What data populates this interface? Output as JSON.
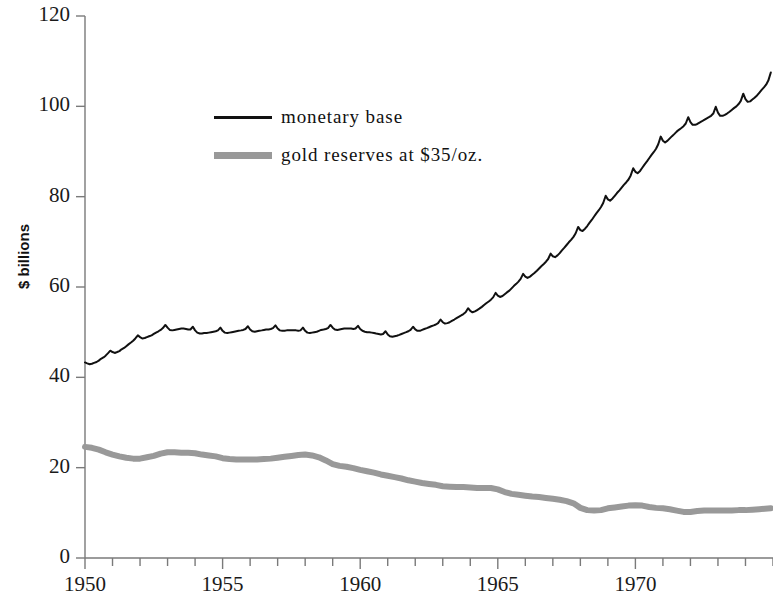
{
  "chart_data": {
    "type": "line",
    "title": "",
    "subtitle": "",
    "xlabel": "",
    "ylabel": "$ billions",
    "xlim": [
      1950,
      1975
    ],
    "ylim": [
      0,
      120
    ],
    "ytick_labels": [
      "0",
      "20",
      "40",
      "60",
      "80",
      "100",
      "120"
    ],
    "ytick_values": [
      0,
      20,
      40,
      60,
      80,
      100,
      120
    ],
    "xtick_labels": [
      "1950",
      "1955",
      "1960",
      "1965",
      "1970"
    ],
    "xtick_values": [
      1950,
      1955,
      1960,
      1965,
      1970
    ],
    "x_minor_tick_interval": 1,
    "grid": false,
    "legend_position": "upper-left-inside",
    "colors": {
      "monetary_base": "#111111",
      "gold_reserves": "#999999",
      "axis": "#7a7a7a",
      "background": "#ffffff"
    },
    "series": [
      {
        "name": "monetary base",
        "color": "#111111",
        "line_width": 2,
        "x": [
          1950.0,
          1950.08,
          1950.17,
          1950.25,
          1950.33,
          1950.42,
          1950.5,
          1950.58,
          1950.67,
          1950.75,
          1950.83,
          1950.92,
          1951.0,
          1951.08,
          1951.17,
          1951.25,
          1951.33,
          1951.42,
          1951.5,
          1951.58,
          1951.67,
          1951.75,
          1951.83,
          1951.92,
          1952.0,
          1952.08,
          1952.17,
          1952.25,
          1952.33,
          1952.42,
          1952.5,
          1952.58,
          1952.67,
          1952.75,
          1952.83,
          1952.92,
          1953.0,
          1953.08,
          1953.17,
          1953.25,
          1953.33,
          1953.42,
          1953.5,
          1953.58,
          1953.67,
          1953.75,
          1953.83,
          1953.92,
          1954.0,
          1954.08,
          1954.17,
          1954.25,
          1954.33,
          1954.42,
          1954.5,
          1954.58,
          1954.67,
          1954.75,
          1954.83,
          1954.92,
          1955.0,
          1955.08,
          1955.17,
          1955.25,
          1955.33,
          1955.42,
          1955.5,
          1955.58,
          1955.67,
          1955.75,
          1955.83,
          1955.92,
          1956.0,
          1956.08,
          1956.17,
          1956.25,
          1956.33,
          1956.42,
          1956.5,
          1956.58,
          1956.67,
          1956.75,
          1956.83,
          1956.92,
          1957.0,
          1957.08,
          1957.17,
          1957.25,
          1957.33,
          1957.42,
          1957.5,
          1957.58,
          1957.67,
          1957.75,
          1957.83,
          1957.92,
          1958.0,
          1958.08,
          1958.17,
          1958.25,
          1958.33,
          1958.42,
          1958.5,
          1958.58,
          1958.67,
          1958.75,
          1958.83,
          1958.92,
          1959.0,
          1959.08,
          1959.17,
          1959.25,
          1959.33,
          1959.42,
          1959.5,
          1959.58,
          1959.67,
          1959.75,
          1959.83,
          1959.92,
          1960.0,
          1960.08,
          1960.17,
          1960.25,
          1960.33,
          1960.42,
          1960.5,
          1960.58,
          1960.67,
          1960.75,
          1960.83,
          1960.92,
          1961.0,
          1961.08,
          1961.17,
          1961.25,
          1961.33,
          1961.42,
          1961.5,
          1961.58,
          1961.67,
          1961.75,
          1961.83,
          1961.92,
          1962.0,
          1962.08,
          1962.17,
          1962.25,
          1962.33,
          1962.42,
          1962.5,
          1962.58,
          1962.67,
          1962.75,
          1962.83,
          1962.92,
          1963.0,
          1963.08,
          1963.17,
          1963.25,
          1963.33,
          1963.42,
          1963.5,
          1963.58,
          1963.67,
          1963.75,
          1963.83,
          1963.92,
          1964.0,
          1964.08,
          1964.17,
          1964.25,
          1964.33,
          1964.42,
          1964.5,
          1964.58,
          1964.67,
          1964.75,
          1964.83,
          1964.92,
          1965.0,
          1965.08,
          1965.17,
          1965.25,
          1965.33,
          1965.42,
          1965.5,
          1965.58,
          1965.67,
          1965.75,
          1965.83,
          1965.92,
          1966.0,
          1966.08,
          1966.17,
          1966.25,
          1966.33,
          1966.42,
          1966.5,
          1966.58,
          1966.67,
          1966.75,
          1966.83,
          1966.92,
          1967.0,
          1967.08,
          1967.17,
          1967.25,
          1967.33,
          1967.42,
          1967.5,
          1967.58,
          1967.67,
          1967.75,
          1967.83,
          1967.92,
          1968.0,
          1968.08,
          1968.17,
          1968.25,
          1968.33,
          1968.42,
          1968.5,
          1968.58,
          1968.67,
          1968.75,
          1968.83,
          1968.92,
          1969.0,
          1969.08,
          1969.17,
          1969.25,
          1969.33,
          1969.42,
          1969.5,
          1969.58,
          1969.67,
          1969.75,
          1969.83,
          1969.92,
          1970.0,
          1970.08,
          1970.17,
          1970.25,
          1970.33,
          1970.42,
          1970.5,
          1970.58,
          1970.67,
          1970.75,
          1970.83,
          1970.92,
          1971.0,
          1971.08,
          1971.17,
          1971.25,
          1971.33,
          1971.42,
          1971.5,
          1971.58,
          1971.67,
          1971.75,
          1971.83,
          1971.92,
          1972.0,
          1972.08,
          1972.17,
          1972.25,
          1972.33,
          1972.42,
          1972.5,
          1972.58,
          1972.67,
          1972.75,
          1972.83,
          1972.92,
          1973.0,
          1973.08,
          1973.17,
          1973.25,
          1973.33,
          1973.42,
          1973.5,
          1973.58,
          1973.67,
          1973.75,
          1973.83,
          1973.92,
          1974.0,
          1974.08,
          1974.17,
          1974.25,
          1974.33,
          1974.42,
          1974.5,
          1974.58,
          1974.67,
          1974.75,
          1974.83,
          1974.92
        ],
        "values": [
          43.3,
          43.1,
          42.9,
          43.0,
          43.2,
          43.4,
          43.7,
          44.1,
          44.4,
          44.8,
          45.3,
          45.9,
          45.6,
          45.4,
          45.6,
          45.8,
          46.2,
          46.5,
          46.9,
          47.3,
          47.7,
          48.1,
          48.6,
          49.3,
          48.9,
          48.6,
          48.7,
          48.9,
          49.1,
          49.3,
          49.6,
          49.9,
          50.2,
          50.5,
          50.9,
          51.6,
          51.0,
          50.5,
          50.4,
          50.5,
          50.6,
          50.7,
          50.8,
          50.8,
          50.7,
          50.6,
          50.6,
          51.2,
          50.4,
          49.9,
          49.7,
          49.7,
          49.8,
          49.8,
          49.9,
          50.0,
          50.1,
          50.2,
          50.4,
          51.0,
          50.3,
          49.9,
          49.8,
          49.9,
          50.0,
          50.1,
          50.2,
          50.3,
          50.4,
          50.5,
          50.7,
          51.3,
          50.6,
          50.2,
          50.1,
          50.2,
          50.3,
          50.4,
          50.5,
          50.6,
          50.6,
          50.7,
          50.9,
          51.5,
          50.8,
          50.4,
          50.3,
          50.3,
          50.4,
          50.4,
          50.4,
          50.4,
          50.4,
          50.3,
          50.4,
          51.0,
          50.3,
          49.9,
          49.8,
          49.9,
          50.0,
          50.1,
          50.3,
          50.5,
          50.6,
          50.7,
          50.9,
          51.6,
          51.0,
          50.6,
          50.5,
          50.6,
          50.7,
          50.8,
          50.8,
          50.8,
          50.8,
          50.7,
          50.8,
          51.4,
          50.7,
          50.3,
          50.1,
          50.0,
          50.0,
          49.9,
          49.8,
          49.7,
          49.6,
          49.5,
          49.6,
          50.2,
          49.5,
          49.1,
          49.0,
          49.1,
          49.2,
          49.4,
          49.6,
          49.8,
          50.0,
          50.2,
          50.5,
          51.2,
          50.6,
          50.3,
          50.3,
          50.5,
          50.7,
          50.9,
          51.1,
          51.3,
          51.5,
          51.7,
          52.0,
          52.8,
          52.2,
          51.9,
          52.0,
          52.2,
          52.5,
          52.8,
          53.1,
          53.4,
          53.7,
          54.0,
          54.4,
          55.3,
          54.7,
          54.4,
          54.6,
          54.9,
          55.2,
          55.6,
          56.0,
          56.4,
          56.8,
          57.2,
          57.7,
          58.7,
          58.1,
          57.8,
          58.0,
          58.4,
          58.8,
          59.2,
          59.7,
          60.2,
          60.7,
          61.2,
          61.8,
          62.9,
          62.3,
          62.0,
          62.3,
          62.7,
          63.1,
          63.6,
          64.1,
          64.6,
          65.1,
          65.6,
          66.2,
          67.4,
          66.8,
          66.6,
          67.0,
          67.5,
          68.1,
          68.7,
          69.3,
          69.9,
          70.5,
          71.1,
          71.9,
          73.3,
          72.6,
          72.4,
          72.9,
          73.5,
          74.2,
          74.9,
          75.6,
          76.3,
          77.0,
          77.7,
          78.6,
          80.2,
          79.4,
          79.1,
          79.6,
          80.2,
          80.8,
          81.4,
          82.0,
          82.6,
          83.2,
          83.8,
          84.7,
          86.3,
          85.5,
          85.2,
          85.7,
          86.4,
          87.1,
          87.8,
          88.5,
          89.2,
          89.9,
          90.6,
          91.6,
          93.3,
          92.4,
          92.0,
          92.4,
          92.9,
          93.4,
          93.9,
          94.4,
          94.8,
          95.2,
          95.6,
          96.2,
          97.6,
          96.5,
          95.9,
          95.9,
          96.1,
          96.4,
          96.7,
          97.0,
          97.3,
          97.6,
          97.9,
          98.4,
          99.9,
          98.6,
          97.9,
          97.9,
          98.1,
          98.4,
          98.8,
          99.2,
          99.6,
          100.0,
          100.5,
          101.2,
          102.8,
          101.6,
          101.0,
          101.1,
          101.5,
          101.9,
          102.4,
          103.0,
          103.6,
          104.2,
          104.8,
          105.7,
          107.5
        ]
      },
      {
        "name": "gold reserves at $35/oz.",
        "color": "#999999",
        "line_width": 6,
        "x": [
          1950.0,
          1950.25,
          1950.5,
          1950.75,
          1951.0,
          1951.25,
          1951.5,
          1951.75,
          1952.0,
          1952.25,
          1952.5,
          1952.75,
          1953.0,
          1953.25,
          1953.5,
          1953.75,
          1954.0,
          1954.25,
          1954.5,
          1954.75,
          1955.0,
          1955.25,
          1955.5,
          1955.75,
          1956.0,
          1956.25,
          1956.5,
          1956.75,
          1957.0,
          1957.25,
          1957.5,
          1957.75,
          1958.0,
          1958.25,
          1958.5,
          1958.75,
          1959.0,
          1959.25,
          1959.5,
          1959.75,
          1960.0,
          1960.25,
          1960.5,
          1960.75,
          1961.0,
          1961.25,
          1961.5,
          1961.75,
          1962.0,
          1962.25,
          1962.5,
          1962.75,
          1963.0,
          1963.25,
          1963.5,
          1963.75,
          1964.0,
          1964.25,
          1964.5,
          1964.75,
          1965.0,
          1965.25,
          1965.5,
          1965.75,
          1966.0,
          1966.25,
          1966.5,
          1966.75,
          1967.0,
          1967.25,
          1967.5,
          1967.75,
          1968.0,
          1968.25,
          1968.5,
          1968.75,
          1969.0,
          1969.25,
          1969.5,
          1969.75,
          1970.0,
          1970.25,
          1970.5,
          1970.75,
          1971.0,
          1971.25,
          1971.5,
          1971.75,
          1972.0,
          1972.25,
          1972.5,
          1972.75,
          1973.0,
          1973.25,
          1973.5,
          1973.75,
          1974.0,
          1974.25,
          1974.5,
          1974.92
        ],
        "values": [
          24.6,
          24.4,
          24.0,
          23.4,
          22.9,
          22.5,
          22.2,
          22.0,
          22.0,
          22.3,
          22.6,
          23.1,
          23.4,
          23.4,
          23.3,
          23.3,
          23.2,
          22.9,
          22.7,
          22.5,
          22.1,
          21.9,
          21.8,
          21.8,
          21.8,
          21.8,
          21.9,
          22.0,
          22.2,
          22.4,
          22.6,
          22.8,
          22.9,
          22.7,
          22.3,
          21.6,
          20.8,
          20.4,
          20.2,
          19.9,
          19.5,
          19.2,
          18.9,
          18.5,
          18.2,
          17.9,
          17.6,
          17.2,
          16.9,
          16.6,
          16.4,
          16.2,
          15.9,
          15.8,
          15.7,
          15.7,
          15.6,
          15.5,
          15.5,
          15.5,
          15.2,
          14.6,
          14.2,
          14.0,
          13.8,
          13.6,
          13.5,
          13.3,
          13.1,
          12.9,
          12.6,
          12.1,
          11.1,
          10.6,
          10.5,
          10.6,
          11.0,
          11.2,
          11.4,
          11.6,
          11.7,
          11.6,
          11.3,
          11.1,
          11.0,
          10.8,
          10.5,
          10.2,
          10.2,
          10.4,
          10.5,
          10.5,
          10.5,
          10.5,
          10.5,
          10.6,
          10.6,
          10.7,
          10.8,
          11.0
        ]
      }
    ]
  },
  "legend": {
    "entries": [
      {
        "label": "monetary base",
        "style": "thin-black"
      },
      {
        "label": "gold reserves at $35/oz.",
        "style": "thick-gray"
      }
    ]
  },
  "axes": {
    "y_title": "$ billions"
  }
}
